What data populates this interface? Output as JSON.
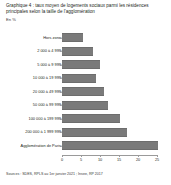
{
  "chart_data": {
    "type": "bar",
    "orientation": "horizontal",
    "title": "Graphique 4 : taux moyen de logements sociaux parmi les résidences principales selon la taille de l'agglomération",
    "subtitle": "En %",
    "xlabel": "",
    "ylabel": "",
    "categories": [
      "Hors zone",
      "2 000 à 4 999",
      "5 000 à 9 999",
      "10 000 à 19 999",
      "20 000 à 49 999",
      "50 000 à 99 999",
      "100 000 à 199 999",
      "200 000 à 1 999 999",
      "Agglomération de Paris"
    ],
    "values": [
      5.5,
      8.2,
      10.0,
      9.0,
      11.0,
      12.0,
      15.3,
      17.0,
      25.2
    ],
    "xlim": [
      0,
      25
    ],
    "xticks": [
      0,
      5,
      10,
      15,
      20,
      25
    ],
    "xtick_labels": [
      "0",
      "5",
      "10",
      "15",
      "20",
      "25"
    ],
    "grid": false,
    "legend": false,
    "bar_color": "#7a7a7a"
  },
  "source": {
    "text": "Sources : SDES, RPLS au 1er janvier 2021 ; Insee, RP 2017"
  }
}
